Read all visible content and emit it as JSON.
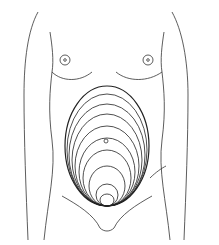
{
  "diagram": {
    "stroke_color": "#333333",
    "background": "#ffffff",
    "ellipse_count": 10,
    "has_umbilicus_marker": true
  }
}
